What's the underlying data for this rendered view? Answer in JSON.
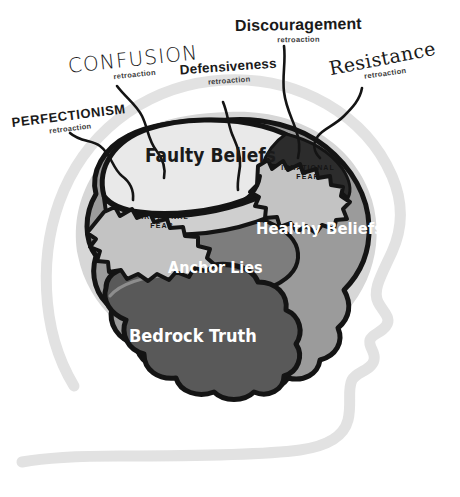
{
  "diagram": {
    "type": "conceptual-layer-diagram",
    "palette": {
      "background": "#ffffff",
      "head_outline": "#e0e0e0",
      "brain_halo": "#d9d9d9",
      "outline_stroke": "#141414",
      "faulty_beliefs_fill": "#e9e9e9",
      "faulty_beliefs_shade": "#c9c9c9",
      "healthy_beliefs_fill": "#9b9b9b",
      "anchor_lies_fill": "#7d7d7d",
      "bedrock_truth_fill": "#595959",
      "fear_band_fill": "#2a2a2a",
      "label_text": "#1a1a1a",
      "inner_light_text": "#ffffff"
    }
  },
  "callouts": [
    {
      "id": "perfectionism",
      "label": "PERFECTIONISM",
      "sublabel": "retroaction"
    },
    {
      "id": "confusion",
      "label": "CONFUSION",
      "sublabel": "retroaction"
    },
    {
      "id": "defensiveness",
      "label": "Defensiveness",
      "sublabel": "retroaction"
    },
    {
      "id": "discouragement",
      "label": "Discouragement",
      "sublabel": "retroaction"
    },
    {
      "id": "resistance",
      "label": "Resistance",
      "sublabel": "retroaction"
    }
  ],
  "layers": [
    {
      "id": "faulty-beliefs",
      "label": "Faulty Beliefs",
      "tone": "light",
      "order": 1
    },
    {
      "id": "healthy-beliefs",
      "label": "Healthy Beliefs",
      "tone": "mid",
      "order": 2
    },
    {
      "id": "anchor-lies",
      "label": "Anchor Lies",
      "tone": "dark",
      "order": 3
    },
    {
      "id": "bedrock-truth",
      "label": "Bedrock Truth",
      "tone": "darkest",
      "order": 4
    }
  ],
  "barriers": [
    {
      "id": "fear-left",
      "line1": "IRRATIONAL",
      "line2": "FEAR"
    },
    {
      "id": "fear-right",
      "line1": "IRRATIONAL",
      "line2": "FEAR"
    }
  ]
}
